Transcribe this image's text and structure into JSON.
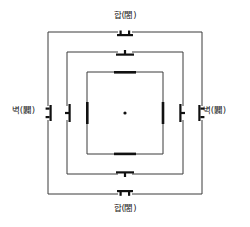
{
  "diagram": {
    "title_visible": false,
    "background_color": "#ffffff",
    "line_color": "#3a3a3a",
    "gate_color": "#111111",
    "labels": {
      "top": "합(閤)",
      "bottom": "합(閤)",
      "left": "벽(闢)",
      "right": "벽(闢)"
    },
    "rings": [
      {
        "name": "outer-enclosure",
        "x": 48,
        "y": 32,
        "width": 154,
        "height": 162,
        "gate_gap": 14,
        "gate_style": "double-post"
      },
      {
        "name": "middle-enclosure",
        "x": 67,
        "y": 52,
        "width": 116,
        "height": 122,
        "gate_gap": 14,
        "gate_style": "single-post"
      },
      {
        "name": "inner-enclosure",
        "x": 87,
        "y": 72,
        "width": 76,
        "height": 82,
        "gate_gap": 18,
        "gate_style": "plain-bar"
      }
    ],
    "center_marker": {
      "name": "center-point",
      "cx": 125,
      "cy": 113,
      "r": 1.6
    },
    "side_gate_markers": {
      "left_outer_x": 48,
      "left_middle_x": 67,
      "left_inner_x": 87,
      "right_inner_x": 163,
      "right_middle_x": 183,
      "right_outer_x": 202,
      "y": 113
    }
  }
}
